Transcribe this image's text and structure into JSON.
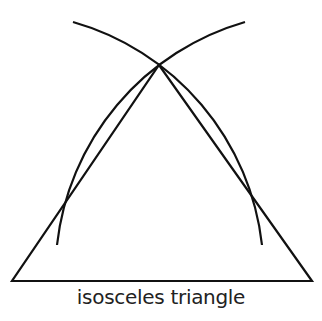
{
  "caption": "isosceles triangle",
  "colors": {
    "stroke": "#111111",
    "text": "#222222",
    "background": "#ffffff"
  },
  "geometry": {
    "triangle": {
      "left_base": [
        12,
        281
      ],
      "right_base": [
        312,
        281
      ],
      "apex": [
        159,
        65
      ]
    },
    "arc_from_left_base": {
      "center": [
        12,
        281
      ],
      "radius": 262,
      "start": [
        73,
        22
      ],
      "end": [
        262,
        245
      ]
    },
    "arc_from_right_base": {
      "center": [
        312,
        281
      ],
      "radius": 262,
      "start": [
        245,
        22
      ],
      "end": [
        57,
        245
      ]
    }
  }
}
